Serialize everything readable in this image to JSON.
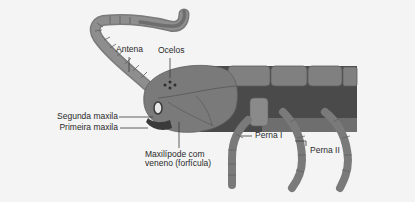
{
  "figure": {
    "colors": {
      "background": "#f4f4f4",
      "segment_light": "#8a8a8a",
      "segment_mid": "#767676",
      "body_dark": "#4a4a4a",
      "outline": "#5e5e5e",
      "text": "#2a2a2a",
      "leader_line": "#3a3a3a"
    },
    "labels": {
      "antenna": "Antena",
      "ocelli": "Ocelos",
      "second_maxilla": "Segunda maxila",
      "first_maxilla": "Primeira maxila",
      "maxilliped_line1": "Maxilípode com",
      "maxilliped_line2": "veneno (forfícula)",
      "leg_1": "Perna I",
      "leg_2": "Perna II"
    }
  }
}
